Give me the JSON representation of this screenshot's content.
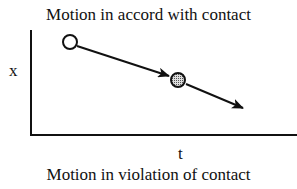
{
  "diagram": {
    "title": "Motion in accord with contact",
    "caption": "Motion in violation of contact",
    "axes": {
      "x_label": "t",
      "y_label": "x"
    },
    "points": [
      {
        "name": "start",
        "style": "open-circle"
      },
      {
        "name": "contact",
        "style": "shaded-circle"
      }
    ],
    "arrows": [
      {
        "from": "start",
        "to": "contact"
      },
      {
        "from": "contact",
        "to": "end"
      }
    ]
  }
}
